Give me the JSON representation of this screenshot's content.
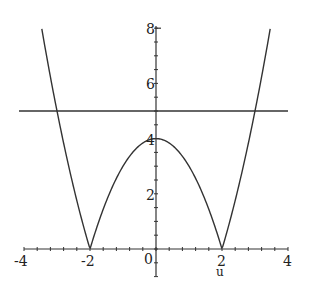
{
  "chart_data": {
    "type": "line",
    "title": "",
    "xlabel": "u",
    "ylabel": "",
    "xlim": [
      -4,
      4
    ],
    "ylim": [
      -1,
      8
    ],
    "x_ticks": [
      "-4",
      "-2",
      "0",
      "2",
      "4"
    ],
    "y_ticks": [
      "2",
      "4",
      "6",
      "8"
    ],
    "grid": false,
    "legend": null,
    "series": [
      {
        "name": "|u^2 - 4|",
        "x": [
          -3.46,
          -3,
          -2.5,
          -2,
          -1.5,
          -1,
          -0.5,
          0,
          0.5,
          1,
          1.5,
          2,
          2.5,
          3,
          3.46
        ],
        "values": [
          8,
          5,
          2.25,
          0,
          1.75,
          3,
          3.75,
          4,
          3.75,
          3,
          1.75,
          0,
          2.25,
          5,
          8
        ]
      },
      {
        "name": "y = 5",
        "x": [
          -4,
          4
        ],
        "values": [
          5,
          5
        ]
      }
    ]
  },
  "axis_labels": {
    "x_neg4": "-4",
    "x_neg2": "-2",
    "x_0": "0",
    "x_2": "2",
    "x_4": "4",
    "y_2": "2",
    "y_4": "4",
    "y_6": "6",
    "y_8": "8",
    "x_title": "u"
  },
  "colors": {
    "line": "#333333",
    "axis": "#333333"
  }
}
